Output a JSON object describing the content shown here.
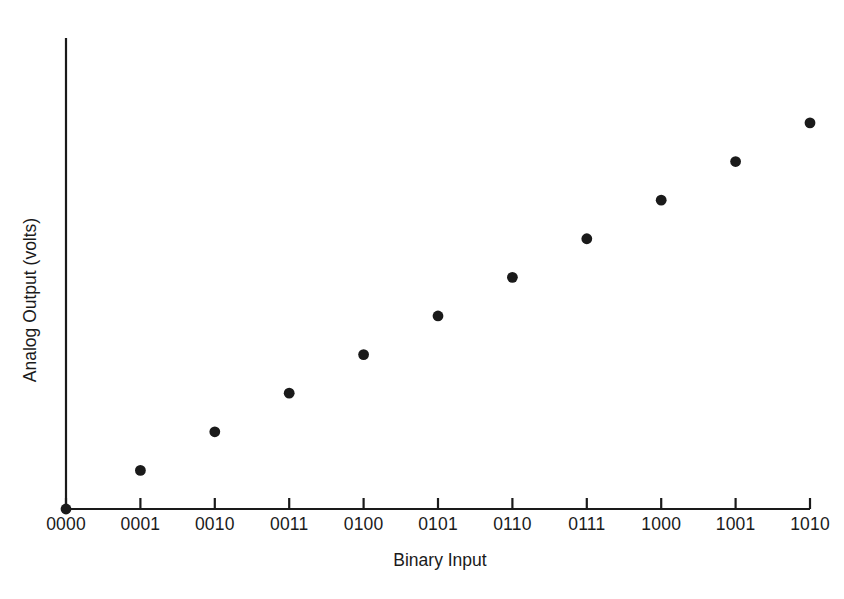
{
  "chart_data": {
    "type": "scatter",
    "title": "",
    "xlabel": "Binary Input",
    "ylabel": "Analog Output (volts)",
    "categories": [
      "0000",
      "0001",
      "0010",
      "0011",
      "0100",
      "0101",
      "0110",
      "0111",
      "1000",
      "1001",
      "1010"
    ],
    "x": [
      0,
      1,
      2,
      3,
      4,
      5,
      6,
      7,
      8,
      9,
      10
    ],
    "values": [
      0,
      1,
      2,
      3,
      4,
      5,
      6,
      7,
      8,
      9,
      10
    ],
    "series": [
      {
        "name": "Analog Output",
        "values": [
          0,
          1,
          2,
          3,
          4,
          5,
          6,
          7,
          8,
          9,
          10
        ]
      }
    ],
    "points": [
      {
        "label": "0000",
        "x": 0,
        "y": 0
      },
      {
        "label": "0001",
        "x": 1,
        "y": 1
      },
      {
        "label": "0010",
        "x": 2,
        "y": 2
      },
      {
        "label": "0011",
        "x": 3,
        "y": 3
      },
      {
        "label": "0100",
        "x": 4,
        "y": 4
      },
      {
        "label": "0101",
        "x": 5,
        "y": 5
      },
      {
        "label": "0110",
        "x": 6,
        "y": 6
      },
      {
        "label": "0111",
        "x": 7,
        "y": 7
      },
      {
        "label": "1000",
        "x": 8,
        "y": 8
      },
      {
        "label": "1001",
        "x": 9,
        "y": 9
      },
      {
        "label": "1010",
        "x": 10,
        "y": 10
      }
    ],
    "xlim": [
      0,
      10
    ],
    "ylim": [
      0,
      12.2
    ],
    "grid": false,
    "legend": false,
    "legend_position": "none",
    "marker": "filled-circle",
    "marker_color": "#1a1a1a",
    "axis_color": "#1a1a1a",
    "background_color": "#ffffff",
    "y_axis_ticks": false,
    "y_axis_tick_labels": []
  },
  "axes": {
    "x_title": "Binary Input",
    "y_title": "Analog Output (volts)",
    "x_tick_labels": [
      "0000",
      "0001",
      "0010",
      "0011",
      "0100",
      "0101",
      "0110",
      "0111",
      "1000",
      "1001",
      "1010"
    ]
  }
}
